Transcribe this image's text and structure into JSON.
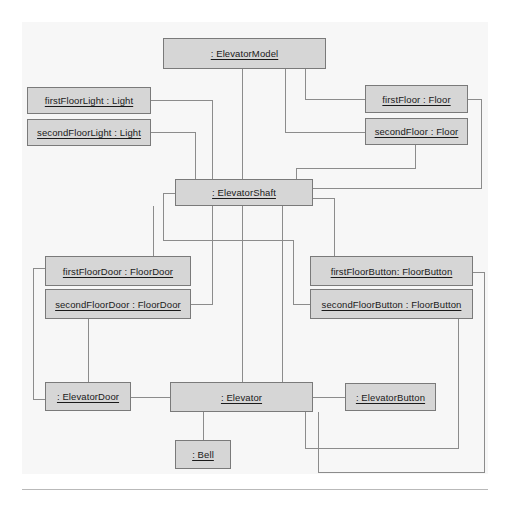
{
  "diagram": {
    "type": "uml-object-diagram",
    "background_color": "#f7f7f7",
    "box_fill_color": "#d6d6d6",
    "box_border_color": "#7a7a7a",
    "line_color": "#8c8c8c",
    "objects": [
      {
        "id": "elevatorModel",
        "label": ": ElevatorModel",
        "x": 163,
        "y": 38,
        "w": 163,
        "h": 31
      },
      {
        "id": "firstFloorLight",
        "label": "firstFloorLight : Light",
        "x": 27,
        "y": 87,
        "w": 124,
        "h": 27
      },
      {
        "id": "secondFloorLight",
        "label": "secondFloorLight : Light",
        "x": 27,
        "y": 119,
        "w": 124,
        "h": 27
      },
      {
        "id": "firstFloor",
        "label": "firstFloor : Floor",
        "x": 365,
        "y": 85,
        "w": 103,
        "h": 28
      },
      {
        "id": "secondFloor",
        "label": "secondFloor : Floor",
        "x": 365,
        "y": 118,
        "w": 103,
        "h": 27
      },
      {
        "id": "elevatorShaft",
        "label": ": ElevatorShaft",
        "x": 175,
        "y": 179,
        "w": 138,
        "h": 27
      },
      {
        "id": "firstFloorDoor",
        "label": "firstFloorDoor : FloorDoor",
        "x": 45,
        "y": 256,
        "w": 146,
        "h": 30
      },
      {
        "id": "secondFloorDoor",
        "label": "secondFloorDoor : FloorDoor",
        "x": 45,
        "y": 289,
        "w": 146,
        "h": 30
      },
      {
        "id": "firstFloorButton",
        "label": "firstFloorButton: FloorButton",
        "x": 310,
        "y": 256,
        "w": 163,
        "h": 30
      },
      {
        "id": "secondFloorButton",
        "label": "secondFloorButton : FloorButton",
        "x": 310,
        "y": 289,
        "w": 163,
        "h": 30
      },
      {
        "id": "elevatorDoor",
        "label": ": ElevatorDoor",
        "x": 45,
        "y": 382,
        "w": 86,
        "h": 29
      },
      {
        "id": "elevator",
        "label": ": Elevator",
        "x": 170,
        "y": 382,
        "w": 143,
        "h": 30
      },
      {
        "id": "elevatorButton",
        "label": ": ElevatorButton",
        "x": 345,
        "y": 383,
        "w": 91,
        "h": 28
      },
      {
        "id": "bell",
        "label": ": Bell",
        "x": 175,
        "y": 440,
        "w": 56,
        "h": 29
      }
    ],
    "links": [
      {
        "id": "model-shaft",
        "from": "elevatorModel",
        "to": "elevatorShaft",
        "path": "M 242,69 L 242,179"
      },
      {
        "id": "model-firstFloor",
        "from": "elevatorModel",
        "to": "firstFloor",
        "path": "M 305,69 L 305,99 L 365,99"
      },
      {
        "id": "model-secondFloor",
        "from": "elevatorModel",
        "to": "secondFloor",
        "path": "M 285,69 L 285,132 L 365,132"
      },
      {
        "id": "firstFloorLight-shaft",
        "from": "firstFloorLight",
        "to": "elevatorShaft",
        "path": "M 151,100 L 212,100 L 212,179"
      },
      {
        "id": "secondFloorLight-shaft",
        "from": "secondFloorLight",
        "to": "elevatorShaft",
        "path": "M 151,132 L 195,132 L 195,179"
      },
      {
        "id": "firstFloor-shaft",
        "from": "firstFloor",
        "to": "elevatorShaft",
        "path": "M 468,99 L 481,99 L 481,188 L 313,188"
      },
      {
        "id": "secondFloor-shaft",
        "from": "secondFloor",
        "to": "elevatorShaft",
        "path": "M 415,145 L 415,168 L 296,168 L 296,179"
      },
      {
        "id": "shaft-firstFloorDoor",
        "from": "elevatorShaft",
        "to": "firstFloorDoor",
        "path": "M 153,206 L 153,256"
      },
      {
        "id": "shaft-secondFloorDoor",
        "from": "elevatorShaft",
        "to": "secondFloorDoor",
        "path": "M 212,206 L 212,304 L 191,304"
      },
      {
        "id": "shaft-elevator",
        "from": "elevatorShaft",
        "to": "elevator",
        "path": "M 242,206 L 242,382"
      },
      {
        "id": "shaft-elevatorDoorSide",
        "from": "elevatorShaft",
        "to": "elevator",
        "path": "M 282,206 L 282,382"
      },
      {
        "id": "shaft-firstFloorButton",
        "from": "elevatorShaft",
        "to": "firstFloorButton",
        "path": "M 313,198 L 334,198 L 334,256"
      },
      {
        "id": "shaft-secondFloorButton",
        "from": "elevatorShaft",
        "to": "secondFloorButton",
        "path": "M 175,193 L 163,193 L 163,240 L 293,240 L 293,304 L 310,304"
      },
      {
        "id": "firstFloorDoor-elevDoor",
        "from": "firstFloorDoor",
        "to": "elevatorDoor",
        "path": "M 45,268 L 33,268 L 33,399 L 45,399"
      },
      {
        "id": "secondFloorDoor-elevDoor",
        "from": "secondFloorDoor",
        "to": "elevatorDoor",
        "path": "M 88,319 L 88,382"
      },
      {
        "id": "elevDoor-elevator",
        "from": "elevatorDoor",
        "to": "elevator",
        "path": "M 131,397 L 170,397"
      },
      {
        "id": "elevator-elevButton",
        "from": "elevator",
        "to": "elevatorButton",
        "path": "M 313,397 L 345,397"
      },
      {
        "id": "elevator-bell",
        "from": "elevator",
        "to": "bell",
        "path": "M 203,412 L 203,440"
      },
      {
        "id": "elevator-secondFloorBtn",
        "from": "elevator",
        "to": "secondFloorButton",
        "path": "M 305,412 L 305,448 L 458,448 L 458,319"
      },
      {
        "id": "elevator-firstFloorBtn",
        "from": "elevator",
        "to": "firstFloorButton",
        "path": "M 318,412 L 318,472 L 484,472 L 484,272 L 473,272"
      }
    ]
  }
}
